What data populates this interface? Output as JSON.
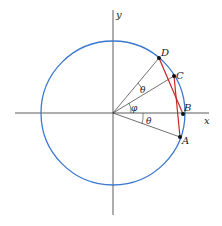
{
  "diagram": {
    "type": "unit-circle-geometry",
    "colors": {
      "circle": "#3a78d0",
      "chords": "#c62828",
      "axes": "#333333",
      "radii": "#333333",
      "points": "#111111"
    },
    "axes": {
      "x_label": "x",
      "y_label": "y"
    },
    "points": [
      {
        "id": "A",
        "label": "A"
      },
      {
        "id": "B",
        "label": "B"
      },
      {
        "id": "C",
        "label": "C"
      },
      {
        "id": "D",
        "label": "D"
      }
    ],
    "angles": [
      {
        "id": "theta-bottom",
        "label": "θ",
        "between": "OA-OB"
      },
      {
        "id": "phi",
        "label": "φ",
        "between": "OB-OC"
      },
      {
        "id": "theta-top",
        "label": "θ",
        "between": "OC-OD"
      }
    ],
    "chords": [
      "A-C",
      "B-D"
    ]
  }
}
